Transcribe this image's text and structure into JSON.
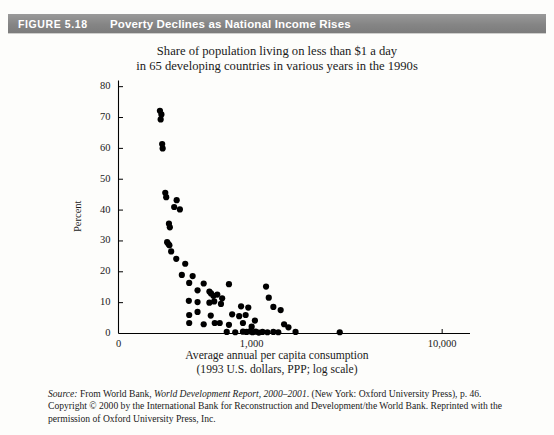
{
  "figure": {
    "tag": "FIGURE 5.18",
    "title": "Poverty Declines as National Income Rises"
  },
  "chart_title": {
    "line1": "Share of population living on less than $1 a day",
    "line2": "in 65 developing countries in various years in the 1990s"
  },
  "xaxis_title": {
    "line1": "Average annual per capita consumption",
    "line2": "(1993 U.S. dollars, PPP; log scale)"
  },
  "source": {
    "label": "Source:",
    "text_a": " From World Bank, ",
    "italic_a": "World Development Report, 2000–2001",
    "text_b": ". (New York: Oxford University Press), p. 46. Copyright © 2000 by the International Bank for Reconstruction and Development/the World Bank. Reprinted with the permission of Oxford University Press, Inc."
  },
  "chart_data": {
    "type": "scatter",
    "title": "Share of population living on less than $1 a day in 65 developing countries in various years in the 1990s",
    "xlabel": "Average annual per capita consumption (1993 U.S. dollars, PPP; log scale)",
    "ylabel": "Percent",
    "xscale": "log",
    "xlim": [
      200,
      14000
    ],
    "ylim": [
      0,
      82
    ],
    "ytick_values": [
      0,
      10,
      20,
      30,
      40,
      50,
      60,
      70,
      80
    ],
    "ytick_labels": [
      "0",
      "10",
      "20",
      "30",
      "40",
      "50",
      "60",
      "70",
      "80"
    ],
    "xtick_values": [
      220,
      1000,
      10000
    ],
    "xtick_labels": [
      "0",
      "1,000",
      "10,000"
    ],
    "grid": false,
    "legend": null,
    "marker": {
      "shape": "circle",
      "color": "#000000",
      "size": 4.2
    },
    "points": [
      {
        "x": 330,
        "y": 72.2
      },
      {
        "x": 336,
        "y": 71.0
      },
      {
        "x": 333,
        "y": 69.4
      },
      {
        "x": 339,
        "y": 61.4
      },
      {
        "x": 341,
        "y": 60.0
      },
      {
        "x": 352,
        "y": 45.6
      },
      {
        "x": 356,
        "y": 44.2
      },
      {
        "x": 404,
        "y": 43.2
      },
      {
        "x": 392,
        "y": 41.0
      },
      {
        "x": 420,
        "y": 40.2
      },
      {
        "x": 368,
        "y": 35.6
      },
      {
        "x": 372,
        "y": 34.4
      },
      {
        "x": 360,
        "y": 29.6
      },
      {
        "x": 366,
        "y": 29.0
      },
      {
        "x": 370,
        "y": 28.6
      },
      {
        "x": 378,
        "y": 26.6
      },
      {
        "x": 402,
        "y": 24.2
      },
      {
        "x": 448,
        "y": 22.6
      },
      {
        "x": 430,
        "y": 19.0
      },
      {
        "x": 490,
        "y": 18.6
      },
      {
        "x": 470,
        "y": 16.4
      },
      {
        "x": 560,
        "y": 16.2
      },
      {
        "x": 760,
        "y": 16.0
      },
      {
        "x": 1190,
        "y": 15.2
      },
      {
        "x": 520,
        "y": 14.0
      },
      {
        "x": 600,
        "y": 13.6
      },
      {
        "x": 612,
        "y": 13.0
      },
      {
        "x": 630,
        "y": 12.2
      },
      {
        "x": 660,
        "y": 12.6
      },
      {
        "x": 700,
        "y": 11.4
      },
      {
        "x": 1230,
        "y": 11.6
      },
      {
        "x": 468,
        "y": 10.6
      },
      {
        "x": 520,
        "y": 10.2
      },
      {
        "x": 600,
        "y": 10.0
      },
      {
        "x": 636,
        "y": 10.4
      },
      {
        "x": 690,
        "y": 9.6
      },
      {
        "x": 880,
        "y": 8.8
      },
      {
        "x": 960,
        "y": 8.4
      },
      {
        "x": 1300,
        "y": 8.6
      },
      {
        "x": 1420,
        "y": 7.6
      },
      {
        "x": 470,
        "y": 6.0
      },
      {
        "x": 520,
        "y": 7.0
      },
      {
        "x": 610,
        "y": 5.8
      },
      {
        "x": 790,
        "y": 6.2
      },
      {
        "x": 860,
        "y": 5.6
      },
      {
        "x": 930,
        "y": 6.0
      },
      {
        "x": 1040,
        "y": 4.2
      },
      {
        "x": 470,
        "y": 3.4
      },
      {
        "x": 560,
        "y": 3.0
      },
      {
        "x": 640,
        "y": 3.4
      },
      {
        "x": 680,
        "y": 3.4
      },
      {
        "x": 760,
        "y": 2.8
      },
      {
        "x": 900,
        "y": 3.4
      },
      {
        "x": 1000,
        "y": 2.2
      },
      {
        "x": 1480,
        "y": 3.0
      },
      {
        "x": 1560,
        "y": 2.0
      },
      {
        "x": 740,
        "y": 0.5
      },
      {
        "x": 820,
        "y": 0.4
      },
      {
        "x": 900,
        "y": 0.6
      },
      {
        "x": 940,
        "y": 0.5
      },
      {
        "x": 980,
        "y": 0.7
      },
      {
        "x": 1010,
        "y": 0.4
      },
      {
        "x": 1050,
        "y": 0.6
      },
      {
        "x": 1090,
        "y": 0.3
      },
      {
        "x": 1140,
        "y": 0.5
      },
      {
        "x": 1210,
        "y": 0.4
      },
      {
        "x": 1300,
        "y": 0.5
      },
      {
        "x": 1380,
        "y": 0.4
      },
      {
        "x": 1700,
        "y": 0.5
      },
      {
        "x": 2900,
        "y": 0.4
      }
    ]
  }
}
